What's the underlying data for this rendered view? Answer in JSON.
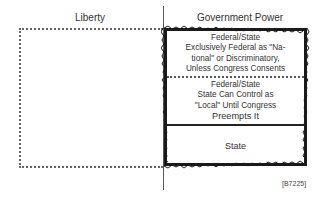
{
  "diagram": {
    "left_header": "Liberty",
    "right_header": "Government Power",
    "sections": [
      {
        "title": "Federal/State",
        "lines": [
          "Exclusively Federal as \"Na-",
          "tional\" or Discriminatory,",
          "Unless Congress Consents"
        ]
      },
      {
        "title": "Federal/State",
        "lines": [
          "State Can Control as",
          "\"Local\" Until Congress",
          "Preempts It"
        ]
      },
      {
        "title": "State",
        "lines": []
      }
    ],
    "caption": "[B7225]"
  },
  "colors": {
    "line": "#1a1a1a",
    "dotted": "#666666",
    "text": "#333333"
  }
}
